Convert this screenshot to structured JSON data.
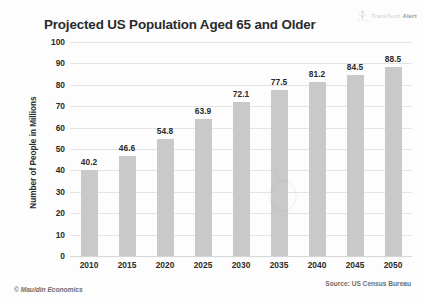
{
  "logo": {
    "icon": "transtech-logo-icon",
    "brand": "TransTech",
    "suffix": "Alert"
  },
  "footer": {
    "copyright": "© Mauldin Economics",
    "source": "Source: US Census Bureau"
  },
  "chart_data": {
    "type": "bar",
    "title": "Projected US Population Aged 65 and Older",
    "xlabel": "",
    "ylabel": "Number of People in Millions",
    "categories": [
      "2010",
      "2015",
      "2020",
      "2025",
      "2030",
      "2035",
      "2040",
      "2045",
      "2050"
    ],
    "values": [
      40.2,
      46.6,
      54.8,
      63.9,
      72.1,
      77.5,
      81.2,
      84.5,
      88.5
    ],
    "data_labels": [
      "40.2",
      "46.6",
      "54.8",
      "63.9",
      "72.1",
      "77.5",
      "81.2",
      "84.5",
      "88.5"
    ],
    "ylim": [
      0,
      100
    ],
    "yticks": [
      100,
      90,
      80,
      70,
      60,
      50,
      40,
      30,
      20,
      10,
      0
    ],
    "ytick_labels": [
      "100",
      "90",
      "80",
      "70",
      "60",
      "50",
      "40",
      "30",
      "20",
      "10",
      "0"
    ],
    "grid": true,
    "legend": false,
    "bar_color": "#c9c9c9",
    "grid_color": "#e4e4e4",
    "text_color": "#2b2b2b",
    "background": "#fdfdfd"
  }
}
